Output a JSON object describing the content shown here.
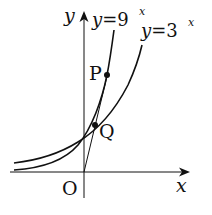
{
  "diagram": {
    "type": "graph-of-exponential-functions",
    "axes": {
      "x_label": "x",
      "y_label": "y",
      "origin_label": "O"
    },
    "curves": [
      {
        "name": "y=9^x",
        "label_base": "y=9",
        "label_exp": "x"
      },
      {
        "name": "y=3^x",
        "label_base": "y=3",
        "label_exp": "x"
      }
    ],
    "points": [
      {
        "label": "P",
        "on": "y=9^x"
      },
      {
        "label": "Q",
        "on": "y=3^x"
      }
    ],
    "line": {
      "from": "O",
      "through": [
        "Q",
        "P"
      ]
    },
    "colors": {
      "stroke": "#111111",
      "background": "#ffffff"
    }
  }
}
